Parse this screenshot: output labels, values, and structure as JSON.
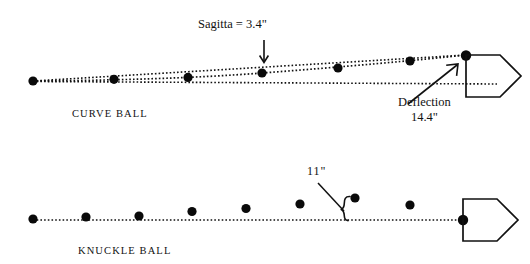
{
  "figure": {
    "background_color": "#ffffff",
    "ink_color": "#111111",
    "width": 530,
    "height": 264
  },
  "annotations": {
    "sagitta_label": "Sagitta = 3.4\"",
    "deflection_label_line1": "Deflection",
    "deflection_label_line2": "14.4\"",
    "knuckle_offset_label": "11\""
  },
  "panels": [
    {
      "id": "curve-ball",
      "caption": "CURVE BALL",
      "caption_x": 72,
      "caption_y": 106,
      "straight_reference_line": {
        "x1": 33,
        "y1": 81,
        "x2": 466,
        "y2": 82
      },
      "chord_line": {
        "x1": 33,
        "y1": 81,
        "x2": 466,
        "y2": 55
      },
      "trajectory_points": [
        {
          "x": 33,
          "y": 81
        },
        {
          "x": 114,
          "y": 79
        },
        {
          "x": 188,
          "y": 78
        },
        {
          "x": 262,
          "y": 73
        },
        {
          "x": 338,
          "y": 68
        },
        {
          "x": 410,
          "y": 61
        },
        {
          "x": 466,
          "y": 55
        }
      ],
      "home_plate": {
        "x": 466,
        "y": 55,
        "w": 58,
        "h": 42
      },
      "sagitta_arrow": {
        "x": 264,
        "y1": 40,
        "y2": 63
      },
      "deflection_arrow": {
        "x1": 410,
        "y1": 103,
        "x2": 457,
        "y2": 66
      }
    },
    {
      "id": "knuckle-ball",
      "caption": "KNUCKLE BALL",
      "caption_x": 78,
      "caption_y": 243,
      "straight_reference_line": {
        "x1": 33,
        "y1": 220,
        "x2": 463,
        "y2": 220
      },
      "trajectory_points": [
        {
          "x": 33,
          "y": 219
        },
        {
          "x": 86,
          "y": 217
        },
        {
          "x": 139,
          "y": 216
        },
        {
          "x": 192,
          "y": 212
        },
        {
          "x": 246,
          "y": 209
        },
        {
          "x": 300,
          "y": 204
        },
        {
          "x": 355,
          "y": 198
        },
        {
          "x": 410,
          "y": 205
        },
        {
          "x": 463,
          "y": 220
        }
      ],
      "home_plate": {
        "x": 463,
        "y": 220,
        "w": 58,
        "h": 42
      },
      "offset_brace": {
        "x": 348,
        "y_top": 199,
        "y_bottom": 220
      },
      "offset_leader": {
        "x1": 319,
        "y1": 184,
        "x2": 345,
        "y2": 211
      }
    }
  ]
}
